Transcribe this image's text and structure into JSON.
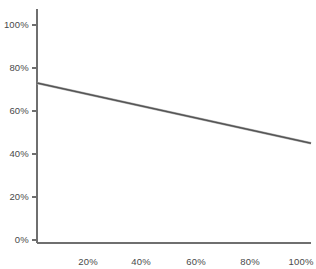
{
  "chart_data": {
    "type": "line",
    "title": "",
    "subtitle": "",
    "xlabel": "",
    "ylabel": "",
    "xlim": [
      0,
      100
    ],
    "ylim": [
      0,
      100
    ],
    "grid": false,
    "legend": false,
    "legend_position": "none",
    "x_tick_labels": [
      "20%",
      "40%",
      "60%",
      "80%",
      "100%"
    ],
    "x_tick_values": [
      20,
      40,
      60,
      80,
      100
    ],
    "y_tick_labels": [
      "0%",
      "20%",
      "40%",
      "60%",
      "80%",
      "100%"
    ],
    "y_tick_values": [
      0,
      20,
      40,
      60,
      80,
      100
    ],
    "series": [
      {
        "name": "",
        "color": "#555555",
        "x": [
          0,
          100
        ],
        "values": [
          73,
          45
        ]
      }
    ]
  },
  "axes": {
    "x_axis_name": "x-axis",
    "y_axis_name": "y-axis"
  }
}
